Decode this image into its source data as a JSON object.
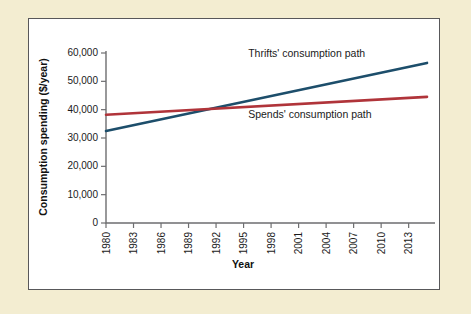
{
  "figure": {
    "background_color": "#f3edd1",
    "panel_color": "#ffffff",
    "border_color": "#58585a"
  },
  "chart_data": {
    "type": "line",
    "title": "",
    "xlabel": "Year",
    "ylabel": "Consumption spending ($/year)",
    "xlim": [
      1980,
      2015
    ],
    "ylim": [
      0,
      60000
    ],
    "grid": false,
    "legend_position": "inline-annotations",
    "x_tick_labels": [
      "1980",
      "1983",
      "1986",
      "1989",
      "1992",
      "1995",
      "1998",
      "2001",
      "2004",
      "2007",
      "2010",
      "2013"
    ],
    "x_ticks": [
      1980,
      1983,
      1986,
      1989,
      1992,
      1995,
      1998,
      2001,
      2004,
      2007,
      2010,
      2013
    ],
    "y_tick_labels": [
      "0",
      "10,000",
      "20,000",
      "30,000",
      "40,000",
      "50,000",
      "60,000"
    ],
    "y_ticks": [
      0,
      10000,
      20000,
      30000,
      40000,
      50000,
      60000
    ],
    "series": [
      {
        "name": "Thrifts' consumption path",
        "color": "#1d4e6b",
        "x": [
          1980,
          2015
        ],
        "values": [
          32500,
          56500
        ],
        "annotation": "Thrifts' consumption path",
        "annotation_x": 1995.5,
        "annotation_y": 58500
      },
      {
        "name": "Spends' consumption path",
        "color": "#b0343a",
        "x": [
          1980,
          2015
        ],
        "values": [
          38200,
          44500
        ],
        "annotation": "Spends' consumption path",
        "annotation_x": 1995.5,
        "annotation_y": 37000
      }
    ],
    "crossover": {
      "x": 1994.8,
      "y": 41000
    }
  }
}
